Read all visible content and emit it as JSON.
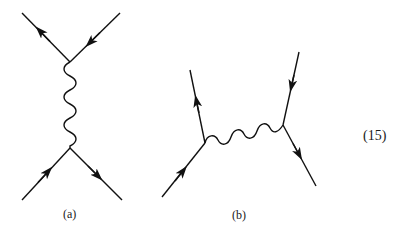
{
  "figure": {
    "diagrams": [
      {
        "id": "a",
        "label": "(a)",
        "description": "t-channel exchange: two fermion lines joined by a vertical wavy photon propagator",
        "vertices": [
          {
            "x": 70,
            "y": 62
          },
          {
            "x": 70,
            "y": 148
          }
        ],
        "fermion_lines": [
          {
            "from": [
              22,
              13
            ],
            "to": [
              70,
              62
            ],
            "arrow": "toward-outer"
          },
          {
            "from": [
              120,
              13
            ],
            "to": [
              70,
              62
            ],
            "arrow": "toward-vertex"
          },
          {
            "from": [
              22,
              200
            ],
            "to": [
              70,
              148
            ],
            "arrow": "toward-vertex"
          },
          {
            "from": [
              70,
              148
            ],
            "to": [
              122,
              200
            ],
            "arrow": "away-from-vertex"
          }
        ],
        "photon": {
          "from": [
            70,
            62
          ],
          "to": [
            70,
            148
          ],
          "orientation": "vertical"
        }
      },
      {
        "id": "b",
        "label": "(b)",
        "description": "exchange diagram with a horizontal wavy photon propagator between two vertices",
        "vertices": [
          {
            "x": 205,
            "y": 143
          },
          {
            "x": 283,
            "y": 125
          }
        ],
        "fermion_lines": [
          {
            "from": [
              162,
              197
            ],
            "to": [
              205,
              143
            ],
            "arrow": "toward-vertex"
          },
          {
            "from": [
              205,
              143
            ],
            "to": [
              190,
              70
            ],
            "arrow": "away-from-vertex"
          },
          {
            "from": [
              299,
              52
            ],
            "to": [
              283,
              125
            ],
            "arrow": "toward-vertex"
          },
          {
            "from": [
              283,
              125
            ],
            "to": [
              316,
              186
            ],
            "arrow": "away-from-vertex"
          }
        ],
        "photon": {
          "from": [
            205,
            143
          ],
          "to": [
            283,
            125
          ],
          "orientation": "horizontal"
        }
      }
    ],
    "equation_number": "(15)"
  },
  "colors": {
    "line": "#111111",
    "background": "#ffffff"
  }
}
